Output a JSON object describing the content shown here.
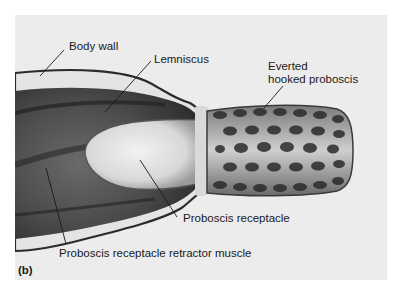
{
  "figure": {
    "panel_label": "(b)",
    "background_color": "#ececec",
    "labels": {
      "body_wall": "Body wall",
      "lemniscus": "Lemniscus",
      "everted_line1": "Everted",
      "everted_line2": "hooked proboscis",
      "proboscis_receptacle": "Proboscis receptacle",
      "retractor_muscle": "Proboscis receptacle retractor muscle"
    }
  }
}
